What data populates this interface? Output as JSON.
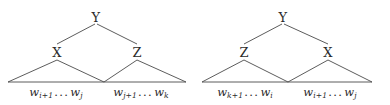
{
  "figure": {
    "kind": "parse-tree-pair",
    "background_color": "#ffffff",
    "line_color": "#4a4a4a",
    "text_color": "#2b2b2b",
    "trees": [
      {
        "id": "left-tree",
        "root": {
          "label": "Y"
        },
        "children": [
          {
            "label": "X",
            "span_text": "w_{i+1} ... w_j",
            "word_symbol": "w",
            "start_subscript": "i+1",
            "end_subscript": "j",
            "ellipsis": "..."
          },
          {
            "label": "Z",
            "span_text": "w_{j+1} ... w_k",
            "word_symbol": "w",
            "start_subscript": "j+1",
            "end_subscript": "k",
            "ellipsis": "..."
          }
        ]
      },
      {
        "id": "right-tree",
        "root": {
          "label": "Y"
        },
        "children": [
          {
            "label": "Z",
            "span_text": "w_{k+1} ... w_i",
            "word_symbol": "w",
            "start_subscript": "k+1",
            "end_subscript": "i",
            "ellipsis": "..."
          },
          {
            "label": "X",
            "span_text": "w_{i+1} ... w_j",
            "word_symbol": "w",
            "start_subscript": "i+1",
            "end_subscript": "j",
            "ellipsis": "..."
          }
        ]
      }
    ]
  }
}
